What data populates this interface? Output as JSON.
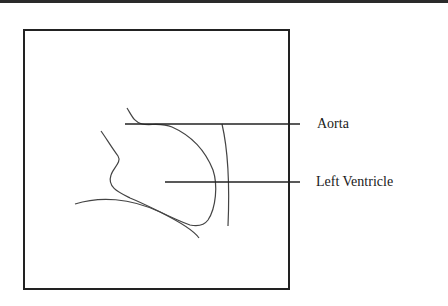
{
  "figure": {
    "labels": {
      "aorta": "Aorta",
      "left_ventricle": "Left Ventricle"
    },
    "colors": {
      "line": "#222222",
      "sketch": "#444444",
      "background": "#ffffff"
    }
  }
}
